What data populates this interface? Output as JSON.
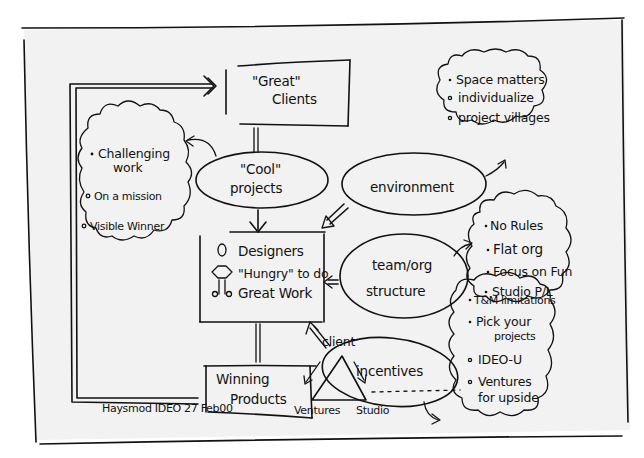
{
  "diagram": {
    "signature": "Haysmod IDEO 27 Feb00",
    "nodes": {
      "great_clients": {
        "line1": "\"Great\"",
        "line2": "Clients"
      },
      "cool_projects": {
        "line1": "\"Cool\"",
        "line2": "projects"
      },
      "designers": {
        "line1": "Designers",
        "line2": "\"Hungry\" to do",
        "line3": "Great Work"
      },
      "winning_products": {
        "line1": "Winning",
        "line2": "Products"
      },
      "environment": {
        "label": "environment"
      },
      "team_org": {
        "line1": "team/org",
        "line2": "structure"
      },
      "incentives": {
        "label": "incentives"
      },
      "triangle": {
        "top": "client",
        "left": "Ventures",
        "right": "Studio"
      }
    },
    "clouds": {
      "cool_projects_cloud": {
        "items": [
          "Challenging work",
          "On a mission",
          "Visible Winner"
        ],
        "item_lines": [
          [
            "Challenging",
            "work"
          ],
          [
            "On a mission"
          ],
          [
            "Visible Winner"
          ]
        ]
      },
      "environment_cloud": {
        "items": [
          "Space matters",
          "individualize",
          "project villages"
        ]
      },
      "team_cloud": {
        "items": [
          "No Rules",
          "Flat org",
          "Focus on Fun",
          "Studio P/L"
        ]
      },
      "incentives_cloud": {
        "items": [
          "T&M limitations",
          "Pick your projects",
          "IDEO-U",
          "Ventures for upside"
        ],
        "item_lines": [
          [
            "T&M limitations"
          ],
          [
            "Pick your",
            "projects"
          ],
          [
            "IDEO-U"
          ],
          [
            "Ventures",
            "for upside"
          ]
        ]
      }
    },
    "colors": {
      "ink": "#111111",
      "paper": "#f2f2f2",
      "background": "#ffffff"
    }
  }
}
